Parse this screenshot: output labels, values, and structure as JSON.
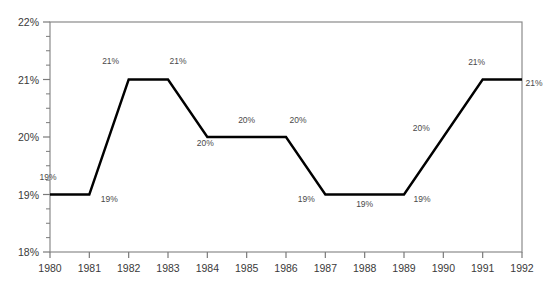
{
  "chart_data": {
    "type": "line",
    "title": "",
    "subtitle": "",
    "xlabel": "",
    "ylabel": "",
    "x": [
      1980,
      1981,
      1982,
      1983,
      1984,
      1985,
      1986,
      1987,
      1988,
      1989,
      1990,
      1991,
      1992
    ],
    "categories": [
      "1980",
      "1981",
      "1982",
      "1983",
      "1984",
      "1985",
      "1986",
      "1987",
      "1988",
      "1989",
      "1990",
      "1991",
      "1992"
    ],
    "values": [
      19,
      19,
      21,
      21,
      20,
      20,
      20,
      19,
      19,
      19,
      20,
      21,
      21
    ],
    "point_labels": [
      "19%",
      "19%",
      "21%",
      "21%",
      "20%",
      "20%",
      "20%",
      "19%",
      "19%",
      "19%",
      "20%",
      "21%",
      "21%"
    ],
    "series": [
      {
        "name": "",
        "values": [
          19,
          19,
          21,
          21,
          20,
          20,
          20,
          19,
          19,
          19,
          20,
          21,
          21
        ],
        "color": "#000000"
      }
    ],
    "ylim": [
      18,
      22
    ],
    "ytick_values": [
      18,
      19,
      20,
      21,
      22
    ],
    "ytick_labels": [
      "18%",
      "19%",
      "20%",
      "21%",
      "22%"
    ],
    "yminor_step": 0.25,
    "xlim": [
      1980,
      1992
    ],
    "xtick_labels": [
      "1980",
      "1981",
      "1982",
      "1983",
      "1984",
      "1985",
      "1986",
      "1987",
      "1988",
      "1989",
      "1990",
      "1991",
      "1992"
    ],
    "grid": false,
    "legend": null,
    "legend_position": "none",
    "marker": "none",
    "line_width": 2,
    "colors": {
      "line": "#000000",
      "axis": "#7a7a7a",
      "tick_text": "#3a3a3a",
      "label_text": "#4a4a4a",
      "background": "#ffffff"
    }
  }
}
